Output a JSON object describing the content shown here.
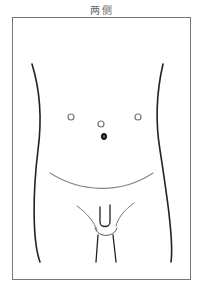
{
  "title": "两侧",
  "diagram": {
    "type": "anatomical-torso-outline",
    "markers": [
      {
        "name": "left-port",
        "style": "open-circle"
      },
      {
        "name": "center-port",
        "style": "open-circle"
      },
      {
        "name": "right-port",
        "style": "open-circle"
      },
      {
        "name": "navel",
        "style": "filled-circle"
      }
    ]
  }
}
